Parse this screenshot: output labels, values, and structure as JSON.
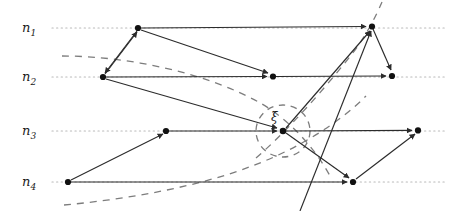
{
  "figure": {
    "type": "worldline-event-diagram",
    "width": 457,
    "height": 211,
    "background": "#ffffff",
    "stroke_color": "#2b2b2b",
    "dotted_color": "#b9b9b9",
    "dashed_color": "#7d7d7d",
    "node_color": "#111111"
  },
  "axes": [
    {
      "id": "n1",
      "label": "n",
      "sub": "1",
      "label_x": 22,
      "label_y": 21,
      "y": 28,
      "x_start": 52,
      "x_end": 447
    },
    {
      "id": "n2",
      "label": "n",
      "sub": "2",
      "label_x": 22,
      "label_y": 70,
      "y": 77,
      "x_start": 52,
      "x_end": 447
    },
    {
      "id": "n3",
      "label": "n",
      "sub": "3",
      "label_x": 22,
      "label_y": 124,
      "y": 131,
      "x_start": 52,
      "x_end": 447
    },
    {
      "id": "n4",
      "label": "n",
      "sub": "4",
      "label_x": 22,
      "label_y": 175,
      "y": 182,
      "x_start": 52,
      "x_end": 447
    }
  ],
  "nodes": [
    {
      "id": "a",
      "axis": "n1",
      "x": 138,
      "y": 28
    },
    {
      "id": "b",
      "axis": "n1",
      "x": 372,
      "y": 26
    },
    {
      "id": "c",
      "axis": "n2",
      "x": 103,
      "y": 77
    },
    {
      "id": "d",
      "axis": "n2",
      "x": 273,
      "y": 76
    },
    {
      "id": "e",
      "axis": "n2",
      "x": 392,
      "y": 76
    },
    {
      "id": "f",
      "axis": "n3",
      "x": 166,
      "y": 131
    },
    {
      "id": "g",
      "axis": "n3",
      "x": 283,
      "y": 131
    },
    {
      "id": "h",
      "axis": "n3",
      "x": 418,
      "y": 130
    },
    {
      "id": "i",
      "axis": "n4",
      "x": 68,
      "y": 182
    },
    {
      "id": "j",
      "axis": "n4",
      "x": 353,
      "y": 182
    }
  ],
  "event": {
    "id": "xi",
    "label": "ξ",
    "node": "g",
    "x": 283,
    "y": 131,
    "label_x": 271,
    "label_y": 112,
    "circle_rx": 27,
    "circle_ry": 26
  },
  "edges": [
    {
      "from": "a",
      "to": "b",
      "kind": "message"
    },
    {
      "from": "a",
      "to": "d",
      "kind": "message"
    },
    {
      "from": "a",
      "to": "c",
      "kind": "message"
    },
    {
      "from": "c",
      "to": "a",
      "kind": "message"
    },
    {
      "from": "c",
      "to": "d",
      "kind": "message"
    },
    {
      "from": "c",
      "to": "e",
      "kind": "message"
    },
    {
      "from": "c",
      "to": "g",
      "kind": "message"
    },
    {
      "from": "d",
      "to": "e",
      "kind": "message"
    },
    {
      "from": "b",
      "to": "e",
      "kind": "message"
    },
    {
      "from": "f",
      "to": "g",
      "kind": "message"
    },
    {
      "from": "g",
      "to": "h",
      "kind": "message"
    },
    {
      "from": "g",
      "to": "j",
      "kind": "message"
    },
    {
      "from": "g",
      "to": "b",
      "kind": "message"
    },
    {
      "from": "j",
      "to": "b",
      "kind": "message"
    },
    {
      "from": "j",
      "to": "h",
      "kind": "message"
    },
    {
      "from": "i",
      "to": "f",
      "kind": "message"
    },
    {
      "from": "i",
      "to": "j",
      "kind": "message"
    }
  ],
  "dashed_curves": [
    {
      "id": "past-cone-upper",
      "desc": "curve from left above n2 descending to lower right"
    },
    {
      "id": "past-cone-lower",
      "desc": "curve from lower left rising to the right"
    },
    {
      "id": "future-cone",
      "desc": "diagonal dashed line rising to top right"
    },
    {
      "id": "event-circle",
      "desc": "dashed ellipse around event xi"
    }
  ]
}
